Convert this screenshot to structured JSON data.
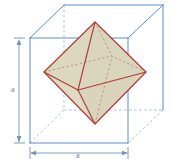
{
  "figure": {
    "labels": {
      "height": "a",
      "width": "a"
    },
    "colors": {
      "cube_edge": "#5b8fc7",
      "cube_hidden_edge": "#9dbcd9",
      "octahedron_edge": "#b03a3a",
      "octahedron_hidden_edge": "#c08a84",
      "octahedron_fill": "#d9d4bb",
      "dimension_line": "#6f93c0",
      "label_text": "#6f7d93",
      "background": "#ffffff"
    },
    "geometry": {
      "cube": {
        "front_top_left": [
          30,
          38
        ],
        "front_top_right": [
          128,
          38
        ],
        "front_bottom_left": [
          30,
          143
        ],
        "front_bottom_right": [
          128,
          143
        ],
        "back_top_left": [
          64,
          5
        ],
        "back_top_right": [
          163,
          5
        ],
        "back_bottom_left": [
          64,
          110
        ],
        "back_bottom_right": [
          163,
          110
        ]
      },
      "octahedron": {
        "top": [
          95,
          22
        ],
        "bottom": [
          95,
          124
        ],
        "left": [
          44,
          72
        ],
        "right": [
          146,
          72
        ],
        "front": [
          78,
          90
        ],
        "back": [
          112,
          56
        ]
      }
    },
    "dimensions": [
      {
        "name": "height",
        "orientation": "vertical",
        "label": "a",
        "from": [
          19,
          40
        ],
        "to": [
          19,
          143
        ]
      },
      {
        "name": "width",
        "orientation": "horizontal",
        "label": "a",
        "from": [
          30,
          153
        ],
        "to": [
          128,
          153
        ]
      }
    ]
  }
}
